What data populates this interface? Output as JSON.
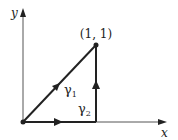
{
  "diagram": {
    "axes": {
      "x_label": "x",
      "y_label": "y"
    },
    "point": {
      "label": "(1, 1)",
      "coords": [
        1,
        1
      ]
    },
    "paths": [
      {
        "name": "gamma1",
        "label": "γ",
        "subscript": "1",
        "description": "straight line from origin to (1,1)"
      },
      {
        "name": "gamma2",
        "label": "γ",
        "subscript": "2",
        "description": "along x-axis from origin to (1,0), then up to (1,1)"
      }
    ],
    "colors": {
      "stroke": "#222222",
      "background": "#ffffff"
    }
  }
}
